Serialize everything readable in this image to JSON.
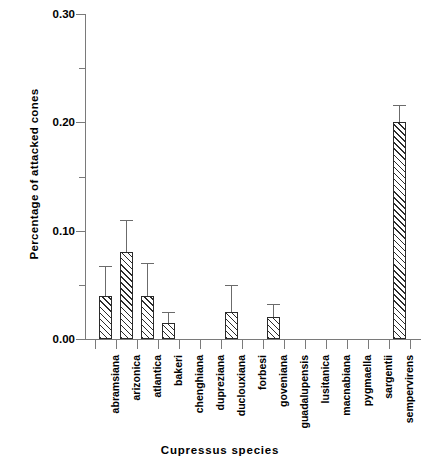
{
  "chart_data": {
    "type": "bar",
    "title": "",
    "xlabel": "Cupressus species",
    "ylabel": "Percentage of attacked cones",
    "ylim": [
      0.0,
      0.3
    ],
    "ytick_labels": [
      "0.00",
      "0.10",
      "0.20",
      "0.30"
    ],
    "ytick_values": [
      0.0,
      0.1,
      0.2,
      0.3
    ],
    "yminor_ticks": [
      0.05,
      0.15,
      0.25
    ],
    "grid": false,
    "legend": "none",
    "categories": [
      "abramsiana",
      "arizonica",
      "atlantica",
      "bakeri",
      "chenghiana",
      "dupreziana",
      "duclouxiana",
      "forbesi",
      "goveniana",
      "guadalupensis",
      "lusitanica",
      "macnabiana",
      "pygmaella",
      "sargentii",
      "sempervirens"
    ],
    "values": [
      0.04,
      0.08,
      0.04,
      0.015,
      0.0,
      0.0,
      0.025,
      0.0,
      0.02,
      0.0,
      0.0,
      0.0,
      0.0,
      0.0,
      0.2
    ],
    "errors_upper": [
      0.0275,
      0.03,
      0.03,
      0.01,
      0.0,
      0.0,
      0.025,
      0.0,
      0.012,
      0.0,
      0.0,
      0.0,
      0.0,
      0.0,
      0.016
    ],
    "bar_fill": "hatched-diagonal",
    "bar_color": "#2b2b2b",
    "error_color": "#6b6b6b"
  }
}
